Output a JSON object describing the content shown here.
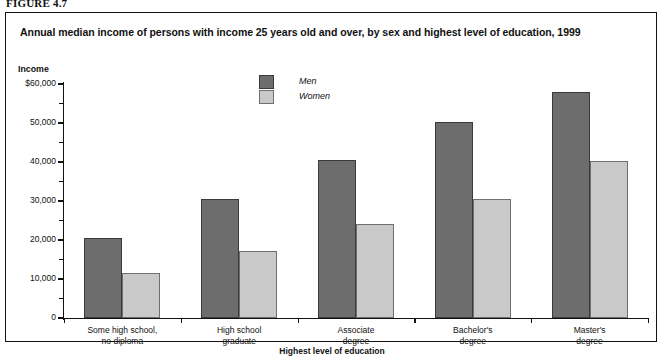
{
  "figure_label": "FIGURE 4.7",
  "chart_title": "Annual median income of persons with income 25 years old and over, by sex and highest level of education, 1999",
  "y_axis_title": "Income",
  "x_axis_title": "Highest level of education",
  "legend": {
    "men_label": "Men",
    "women_label": "Women",
    "men_color": "#6d6d6d",
    "women_color": "#c9c9c9"
  },
  "y_ticks": [
    {
      "value": 60000,
      "label": "$60,000"
    },
    {
      "value": 55000,
      "label": ""
    },
    {
      "value": 50000,
      "label": "50,000"
    },
    {
      "value": 45000,
      "label": ""
    },
    {
      "value": 40000,
      "label": "40,000"
    },
    {
      "value": 35000,
      "label": ""
    },
    {
      "value": 30000,
      "label": "30,000"
    },
    {
      "value": 25000,
      "label": ""
    },
    {
      "value": 20000,
      "label": "20,000"
    },
    {
      "value": 15000,
      "label": ""
    },
    {
      "value": 10000,
      "label": "10,000"
    },
    {
      "value": 5000,
      "label": ""
    },
    {
      "value": 0,
      "label": "0"
    }
  ],
  "chart_data": {
    "type": "bar",
    "title": "Annual median income of persons with income 25 years old and over, by sex and highest level of education, 1999",
    "xlabel": "Highest level of education",
    "ylabel": "Income",
    "ylim": [
      0,
      60000
    ],
    "ytick_values": [
      0,
      10000,
      20000,
      30000,
      40000,
      50000,
      60000
    ],
    "ytick_labels": [
      "0",
      "10,000",
      "20,000",
      "30,000",
      "40,000",
      "50,000",
      "$60,000"
    ],
    "minor_tick_interval": 5000,
    "grid": false,
    "legend_position": "upper-center",
    "categories": [
      [
        "Some high school,",
        "no diploma"
      ],
      [
        "High school",
        "graduate"
      ],
      [
        "Associate",
        "degree"
      ],
      [
        "Bachelor's",
        "degree"
      ],
      [
        "Master's",
        "degree"
      ]
    ],
    "category_labels": [
      "Some high school, no diploma",
      "High school graduate",
      "Associate degree",
      "Bachelor's degree",
      "Master's degree"
    ],
    "series": [
      {
        "name": "Men",
        "color": "#6d6d6d",
        "values": [
          20500,
          30500,
          40500,
          50300,
          58000
        ]
      },
      {
        "name": "Women",
        "color": "#c9c9c9",
        "values": [
          11500,
          17200,
          24000,
          30500,
          40200
        ]
      }
    ]
  }
}
